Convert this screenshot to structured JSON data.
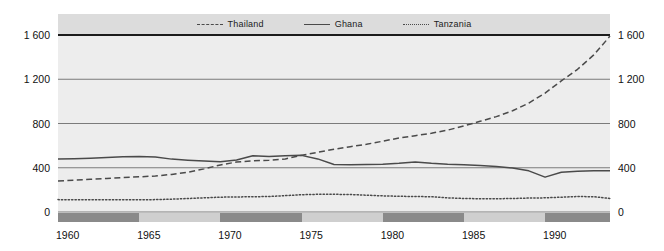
{
  "chart_data": {
    "type": "line",
    "title": "",
    "xlabel": "",
    "ylabel": "",
    "xlim": [
      1960,
      1994
    ],
    "ylim": [
      0,
      1600
    ],
    "grid": true,
    "legend_position": "top-center",
    "y_ticks": [
      "0",
      "400",
      "800",
      "1 200",
      "1 600"
    ],
    "y_tick_values": [
      0,
      400,
      800,
      1200,
      1600
    ],
    "x_ticks": [
      "1960",
      "1965",
      "1970",
      "1975",
      "1980",
      "1985",
      "1990"
    ],
    "x_tick_values": [
      1960,
      1965,
      1970,
      1975,
      1980,
      1985,
      1990
    ],
    "x": [
      1960,
      1961,
      1962,
      1963,
      1964,
      1965,
      1966,
      1967,
      1968,
      1969,
      1970,
      1971,
      1972,
      1973,
      1974,
      1975,
      1976,
      1977,
      1978,
      1979,
      1980,
      1981,
      1982,
      1983,
      1984,
      1985,
      1986,
      1987,
      1988,
      1989,
      1990,
      1991,
      1992,
      1993,
      1994
    ],
    "series": [
      {
        "name": "Thailand",
        "style": "dashed",
        "color": "#4a4a4a",
        "values": [
          281,
          288,
          295,
          303,
          312,
          318,
          326,
          340,
          360,
          390,
          425,
          452,
          462,
          468,
          480,
          512,
          540,
          568,
          590,
          612,
          640,
          668,
          690,
          712,
          740,
          778,
          820,
          862,
          915,
          985,
          1075,
          1185,
          1290,
          1420,
          1590
        ]
      },
      {
        "name": "Ghana",
        "style": "solid",
        "color": "#4a4a4a",
        "values": [
          480,
          482,
          486,
          492,
          500,
          502,
          498,
          478,
          468,
          460,
          455,
          470,
          508,
          502,
          508,
          512,
          480,
          430,
          428,
          430,
          432,
          440,
          452,
          440,
          432,
          428,
          420,
          412,
          398,
          372,
          315,
          360,
          368,
          372,
          374
        ]
      },
      {
        "name": "Tanzania",
        "style": "dotted",
        "color": "#4a4a4a",
        "values": [
          112,
          110,
          110,
          110,
          110,
          110,
          112,
          116,
          122,
          128,
          134,
          136,
          138,
          140,
          148,
          156,
          160,
          160,
          158,
          152,
          146,
          142,
          140,
          138,
          128,
          122,
          120,
          120,
          122,
          126,
          128,
          134,
          140,
          138,
          122
        ]
      }
    ],
    "x_bands": [
      {
        "from": 1960,
        "to": 1965,
        "shade": "dark"
      },
      {
        "from": 1965,
        "to": 1970,
        "shade": "light"
      },
      {
        "from": 1970,
        "to": 1975,
        "shade": "dark"
      },
      {
        "from": 1975,
        "to": 1980,
        "shade": "light"
      },
      {
        "from": 1980,
        "to": 1985,
        "shade": "dark"
      },
      {
        "from": 1985,
        "to": 1990,
        "shade": "light"
      },
      {
        "from": 1990,
        "to": 1994,
        "shade": "dark"
      }
    ],
    "colors": {
      "plot_background": "#ededed",
      "legend_background": "#dcdcdc",
      "line": "#4a4a4a",
      "gridline": "#6e6e6e",
      "axis_emphasis": "#1b1b1b",
      "band_dark": "#8a8a8a",
      "band_light": "#cfcfcf"
    }
  }
}
